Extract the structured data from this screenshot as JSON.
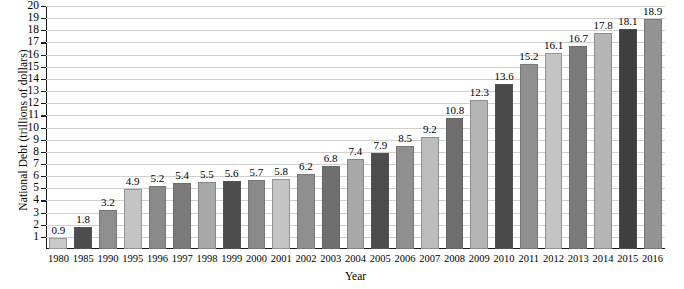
{
  "chart_data": {
    "type": "bar",
    "title": "",
    "xlabel": "Year",
    "ylabel": "National Debt (trillions of dollars)",
    "ylim": [
      0,
      20
    ],
    "ytick_labels": [
      "20",
      "19",
      "18",
      "17",
      "16",
      "15",
      "14",
      "13",
      "12",
      "11",
      "10",
      "9",
      "8",
      "7",
      "6",
      "5",
      "4",
      "3",
      "2",
      "1"
    ],
    "yticks": [
      20,
      19,
      18,
      17,
      16,
      15,
      14,
      13,
      12,
      11,
      10,
      9,
      8,
      7,
      6,
      5,
      4,
      3,
      2,
      1
    ],
    "grid": true,
    "legend": "none",
    "categories": [
      "1980",
      "1985",
      "1990",
      "1995",
      "1996",
      "1997",
      "1998",
      "1999",
      "2000",
      "2001",
      "2002",
      "2003",
      "2004",
      "2005",
      "2006",
      "2007",
      "2008",
      "2009",
      "2010",
      "2011",
      "2012",
      "2013",
      "2014",
      "2015",
      "2016"
    ],
    "values": [
      0.9,
      1.8,
      3.2,
      4.9,
      5.2,
      5.4,
      5.5,
      5.6,
      5.7,
      5.8,
      6.2,
      6.8,
      7.4,
      7.9,
      8.5,
      9.2,
      10.8,
      12.3,
      13.6,
      15.2,
      16.1,
      16.7,
      17.8,
      18.1,
      18.9
    ],
    "value_labels": [
      "0.9",
      "1.8",
      "3.2",
      "4.9",
      "5.2",
      "5.4",
      "5.5",
      "5.6",
      "5.7",
      "5.8",
      "6.2",
      "6.8",
      "7.4",
      "7.9",
      "8.5",
      "9.2",
      "10.8",
      "12.3",
      "13.6",
      "15.2",
      "16.1",
      "16.7",
      "17.8",
      "18.1",
      "18.9"
    ],
    "bar_colors": [
      "#c9c9c9",
      "#4d4d4d",
      "#8f8f8f",
      "#c4c4c4",
      "#8a8a8a",
      "#7a7a7a",
      "#a8a8a8",
      "#4d4d4d",
      "#8a8a8a",
      "#c4c4c4",
      "#8f8f8f",
      "#6e6e6e",
      "#a8a8a8",
      "#4d4d4d",
      "#8f8f8f",
      "#bdbdbd",
      "#6e6e6e",
      "#b5b5b5",
      "#4a4a4a",
      "#8f8f8f",
      "#c4c4c4",
      "#7a7a7a",
      "#b5b5b5",
      "#3f3f3f",
      "#939393"
    ],
    "axis_color": "#1a1a1a",
    "gridline_color": "#cfcfcf",
    "background_color": "#ffffff"
  }
}
